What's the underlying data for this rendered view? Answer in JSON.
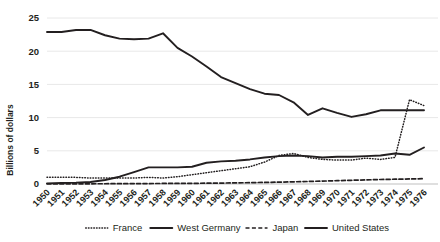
{
  "chart_data": {
    "type": "line",
    "title": "",
    "xlabel": "",
    "ylabel": "Billions of dollars",
    "ylim": [
      0,
      25
    ],
    "yticks": [
      0,
      5,
      10,
      15,
      20,
      25
    ],
    "grid": true,
    "legend_position": "bottom",
    "categories": [
      "1950",
      "1951",
      "1952",
      "1953",
      "1954",
      "1955",
      "1956",
      "1957",
      "1958",
      "1959",
      "1960",
      "1961",
      "1962",
      "1963",
      "1964",
      "1965",
      "1966",
      "1967",
      "1968",
      "1969",
      "1970",
      "1971",
      "1972",
      "1973",
      "1974",
      "1975",
      "1976"
    ],
    "series": [
      {
        "name": "France",
        "style": "dotted",
        "color": "#231f20",
        "values": [
          1.0,
          1.0,
          1.0,
          0.9,
          0.9,
          0.9,
          0.9,
          1.0,
          0.9,
          1.1,
          1.4,
          1.7,
          2.0,
          2.3,
          2.6,
          3.3,
          4.3,
          4.6,
          4.0,
          3.7,
          3.6,
          3.6,
          3.9,
          3.7,
          4.0,
          12.7,
          11.8
        ]
      },
      {
        "name": "West Germany",
        "style": "solid",
        "color": "#231f20",
        "values": [
          0.1,
          0.15,
          0.2,
          0.3,
          0.6,
          1.1,
          1.8,
          2.5,
          2.5,
          2.5,
          2.6,
          3.2,
          3.4,
          3.5,
          3.7,
          4.0,
          4.2,
          4.3,
          4.2,
          4.0,
          4.1,
          4.1,
          4.2,
          4.3,
          4.6,
          4.4,
          5.5
        ]
      },
      {
        "name": "Japan",
        "style": "dashed",
        "color": "#231f20",
        "values": [
          0.02,
          0.02,
          0.03,
          0.03,
          0.04,
          0.05,
          0.06,
          0.07,
          0.08,
          0.09,
          0.1,
          0.12,
          0.14,
          0.17,
          0.2,
          0.24,
          0.28,
          0.33,
          0.38,
          0.44,
          0.5,
          0.56,
          0.62,
          0.68,
          0.72,
          0.76,
          0.8
        ]
      },
      {
        "name": "United States",
        "style": "solid",
        "color": "#231f20",
        "values": [
          22.9,
          22.9,
          23.2,
          23.2,
          22.4,
          21.9,
          21.8,
          21.9,
          22.7,
          20.5,
          19.2,
          17.7,
          16.1,
          15.2,
          14.3,
          13.6,
          13.4,
          12.3,
          10.4,
          11.4,
          10.7,
          10.1,
          10.5,
          11.1,
          11.1,
          11.1,
          11.1
        ]
      }
    ]
  },
  "yaxis": {
    "title": "Billions of dollars",
    "ticks": [
      "0",
      "5",
      "10",
      "15",
      "20",
      "25"
    ]
  },
  "xaxis": {
    "ticks": [
      "1950",
      "1951",
      "1952",
      "1953",
      "1954",
      "1955",
      "1956",
      "1957",
      "1958",
      "1959",
      "1960",
      "1961",
      "1962",
      "1963",
      "1964",
      "1965",
      "1966",
      "1967",
      "1968",
      "1969",
      "1970",
      "1971",
      "1972",
      "1973",
      "1974",
      "1975",
      "1976"
    ]
  },
  "legend": {
    "items": [
      {
        "label": "France",
        "style": "dotted"
      },
      {
        "label": "West Germany",
        "style": "solid"
      },
      {
        "label": "Japan",
        "style": "dashed"
      },
      {
        "label": "United States",
        "style": "solid"
      }
    ]
  }
}
